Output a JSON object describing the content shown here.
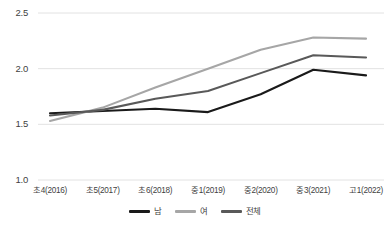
{
  "chart_data": {
    "type": "line",
    "title": "",
    "xlabel": "",
    "ylabel": "",
    "categories": [
      "초4(2016)",
      "초5(2017)",
      "초6(2018)",
      "중1(2019)",
      "중2(2020)",
      "중3(2021)",
      "고1(2022)"
    ],
    "series": [
      {
        "name": "남",
        "color": "#1a1a1a",
        "values": [
          1.6,
          1.62,
          1.64,
          1.61,
          1.77,
          1.99,
          1.94
        ]
      },
      {
        "name": "여",
        "color": "#a6a6a6",
        "values": [
          1.53,
          1.65,
          1.83,
          2.0,
          2.17,
          2.28,
          2.27
        ]
      },
      {
        "name": "전체",
        "color": "#595959",
        "values": [
          1.58,
          1.63,
          1.73,
          1.8,
          1.96,
          2.12,
          2.1
        ]
      }
    ],
    "yticks": [
      1.0,
      1.5,
      2.0,
      2.5
    ],
    "ytick_labels": [
      "1.0",
      "1.5",
      "2.0",
      "2.5"
    ],
    "ylim": [
      1.0,
      2.5
    ],
    "grid": true,
    "legend_position": "bottom"
  },
  "legend": {
    "items": [
      {
        "label": "남",
        "color": "#1a1a1a"
      },
      {
        "label": "여",
        "color": "#a6a6a6"
      },
      {
        "label": "전체",
        "color": "#595959"
      }
    ]
  },
  "caption": {
    "text": ""
  }
}
